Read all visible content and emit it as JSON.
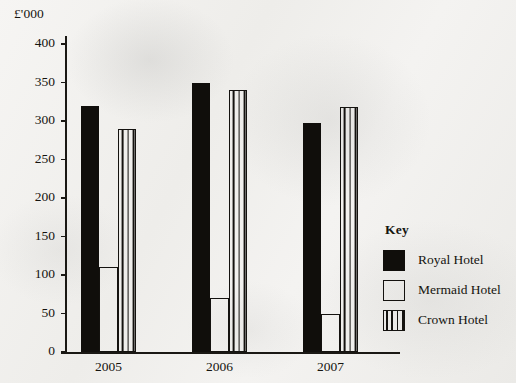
{
  "chart_data": {
    "type": "bar",
    "title": "",
    "subtitle": "",
    "xlabel": "",
    "ylabel": "£'000",
    "unit_label": "£'000",
    "categories": [
      "2005",
      "2006",
      "2007"
    ],
    "series": [
      {
        "name": "Royal Hotel",
        "pattern": "solid",
        "values": [
          320,
          350,
          298
        ]
      },
      {
        "name": "Mermaid Hotel",
        "pattern": "open",
        "values": [
          110,
          70,
          50
        ]
      },
      {
        "name": "Crown Hotel",
        "pattern": "striped",
        "values": [
          290,
          340,
          318
        ]
      }
    ],
    "ylim": [
      0,
      400
    ],
    "ytick_values": [
      0,
      50,
      100,
      150,
      200,
      250,
      300,
      350,
      400
    ],
    "ytick_labels": [
      "0",
      "50",
      "100",
      "150",
      "200",
      "250",
      "300",
      "350",
      "400"
    ],
    "grid": false,
    "legend_position": "right"
  },
  "legend": {
    "title": "Key",
    "entries": [
      {
        "label": "Royal Hotel",
        "pattern": "solid"
      },
      {
        "label": "Mermaid Hotel",
        "pattern": "open"
      },
      {
        "label": "Crown Hotel",
        "pattern": "striped"
      }
    ]
  },
  "colors": {
    "ink": "#14120f",
    "paper": "#f3f2f0"
  }
}
